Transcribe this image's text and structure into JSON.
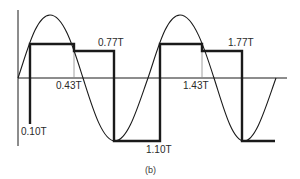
{
  "figure": {
    "caption": "(b)",
    "labels": {
      "t010": "0.10T",
      "t043": "0.43T",
      "t077": "0.77T",
      "t110": "1.10T",
      "t143": "1.43T",
      "t177": "1.77T"
    },
    "colors": {
      "stroke": "#1a1a1a",
      "guide": "#8a8a8a",
      "text": "#2a2a2a"
    }
  }
}
